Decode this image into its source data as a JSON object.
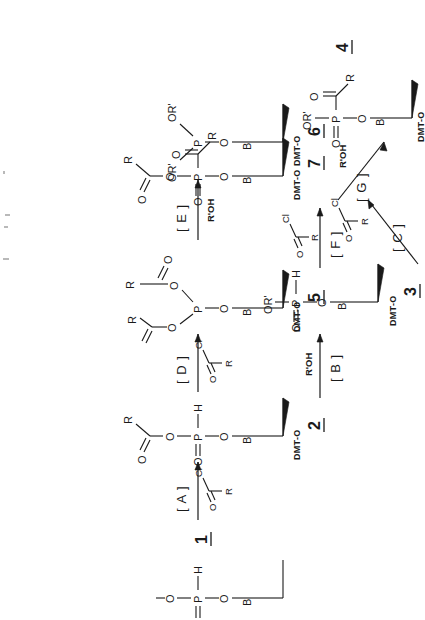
{
  "figure": {
    "kind": "chemical-reaction-scheme",
    "orientation": "rotated-90-ccw"
  },
  "structures": [
    {
      "id": "1",
      "label": "1",
      "name": "nucleoside-H-phosphonate-monoester",
      "atoms": {
        "base": "B",
        "sugar_protect": "DMT-O",
        "o_link": "O",
        "phosphorus": "P",
        "p_double_o": "O",
        "p_h": "H",
        "o_top": "O"
      }
    },
    {
      "id": "2",
      "label": "2",
      "name": "acyl-H-phosphonate-mixed-anhydride",
      "atoms": {
        "base": "B",
        "sugar_protect": "DMT-O",
        "o_link": "O",
        "phosphorus": "P",
        "p_double_o": "O",
        "p_h": "H",
        "o_ester": "O",
        "carbonyl_o": "O",
        "r_group": "R"
      }
    },
    {
      "id": "3",
      "label": "3",
      "name": "nucleoside-H-phosphonate-diester",
      "atoms": {
        "base": "B",
        "sugar_protect": "DMT-O",
        "o_link": "O",
        "phosphorus": "P",
        "p_double_o": "O",
        "p_h": "H",
        "or_prime": "OR'"
      }
    },
    {
      "id": "4",
      "label": "4",
      "name": "acyl-phosphonate-diester",
      "atoms": {
        "base": "B",
        "sugar_protect": "DMT-O",
        "o_link": "O",
        "phosphorus": "P",
        "p_double_o": "O",
        "or_prime": "OR'",
        "carbonyl_o": "O",
        "r_group": "R"
      }
    },
    {
      "id": "5",
      "label": "5",
      "name": "bis-acyloxy-phosphite-triester",
      "atoms": {
        "base": "B",
        "sugar_protect": "DMT-O",
        "o_link": "O",
        "phosphorus": "P",
        "o_ester_a": "O",
        "o_ester_b": "O",
        "carbonyl_o_a": "O",
        "carbonyl_o_b": "O",
        "r_group_a": "R",
        "r_group_b": "R"
      }
    },
    {
      "id": "6",
      "label": "6",
      "name": "phosphite-triester-bis-OR-prime",
      "atoms": {
        "base": "B",
        "sugar_protect": "DMT-O",
        "o_link": "O",
        "phosphorus": "P",
        "or_prime_a": "OR'",
        "or_prime_b": "OR'"
      }
    },
    {
      "id": "7",
      "label": "7",
      "name": "bis-acyl-phosphonate",
      "atoms": {
        "base": "B",
        "sugar_protect": "DMT-O",
        "o_link": "O",
        "phosphorus": "P",
        "p_double_o": "O",
        "o_ester": "O",
        "carbonyl_o_a": "O",
        "carbonyl_o_b": "O",
        "r_group_a": "R",
        "r_group_b": "R"
      }
    }
  ],
  "arrows": [
    {
      "id": "A",
      "label": "[ A ]",
      "reagent_type": "acyl-chloride",
      "reagent_atoms": {
        "carbonyl_o": "O",
        "chloride": "Cl",
        "r_group": "R"
      },
      "from": "1",
      "to": "2",
      "direction": "right"
    },
    {
      "id": "B",
      "label": "[ B ]",
      "reagent_text": "R'OH",
      "from": "2",
      "to": "3",
      "direction": "right"
    },
    {
      "id": "C",
      "label": "[ C ]",
      "reagent_type": "acyl-chloride",
      "reagent_atoms": {
        "carbonyl_o": "O",
        "chloride": "Cl",
        "r_group": "R"
      },
      "from": "3",
      "to": "4",
      "direction": "diagonal"
    },
    {
      "id": "D",
      "label": "[ D ]",
      "reagent_type": "acyl-chloride",
      "reagent_atoms": {
        "carbonyl_o": "O",
        "chloride": "Cl",
        "r_group": "R"
      },
      "from": "2",
      "to": "5",
      "direction": "right"
    },
    {
      "id": "E",
      "label": "[ E ]",
      "reagent_text": "R'OH",
      "from": "5",
      "to": "6",
      "direction": "right"
    },
    {
      "id": "F",
      "label": "[ F ]",
      "reagent_type": "acyl-chloride",
      "reagent_atoms": {
        "carbonyl_o": "O",
        "chloride": "Cl",
        "r_group": "R"
      },
      "from": "5",
      "to": "7",
      "direction": "right"
    },
    {
      "id": "G",
      "label": "[ G ]",
      "reagent_text": "R'OH",
      "from": "7",
      "to": "4",
      "direction": "diagonal"
    }
  ],
  "common_labels": {
    "dmt": "DMT-O",
    "base": "B",
    "oxygen": "O",
    "phosphorus": "P",
    "hydrogen": "H",
    "chlorine": "Cl",
    "r": "R",
    "or_prime": "OR'",
    "r_prime_oh": "R'OH"
  },
  "colors": {
    "ink": "#1a1a1a",
    "background": "#ffffff",
    "speck": "#b9b9b9"
  }
}
